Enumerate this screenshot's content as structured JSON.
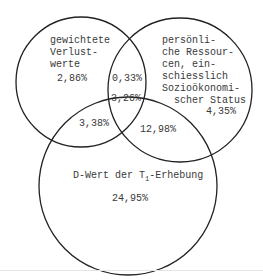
{
  "diagram": {
    "type": "venn",
    "sets": [
      {
        "id": "A",
        "label": "gewichtete\nVerlust-\nwerte",
        "only_value": "2,86%"
      },
      {
        "id": "B",
        "label": "persönli-\nche Ressour-\ncen, ein-\nschiesslich\nSozioökonomi-\n  scher Status",
        "only_value": "4,35%"
      },
      {
        "id": "C",
        "label_prefix": "D-Wert der T",
        "label_sub": "1",
        "label_suffix": "-Erhebung",
        "only_value": "24,95%"
      }
    ],
    "intersections": {
      "AB": "0,33%",
      "ABC": "3,26%",
      "AC": "3,38%",
      "BC": "12,98%"
    },
    "stroke_color": "#222222"
  }
}
